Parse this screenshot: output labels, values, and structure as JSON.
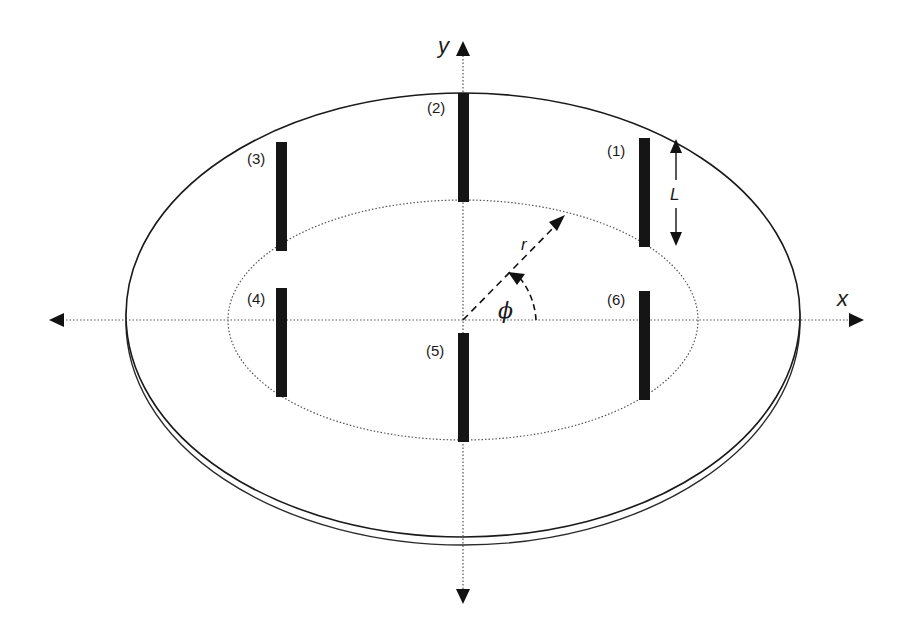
{
  "diagram": {
    "type": "antenna-array-on-disk",
    "axes": {
      "x_label": "x",
      "y_label": "y"
    },
    "elements": [
      {
        "id": 1,
        "label": "(1)"
      },
      {
        "id": 2,
        "label": "(2)"
      },
      {
        "id": 3,
        "label": "(3)"
      },
      {
        "id": 4,
        "label": "(4)"
      },
      {
        "id": 5,
        "label": "(5)"
      },
      {
        "id": 6,
        "label": "(6)"
      }
    ],
    "annotations": {
      "length_label": "L",
      "radius_label": "r",
      "angle_label": "ϕ"
    },
    "colors": {
      "stroke": "#1a1a1a",
      "bar": "#151515",
      "dotted": "#555555",
      "background": "#ffffff"
    }
  }
}
